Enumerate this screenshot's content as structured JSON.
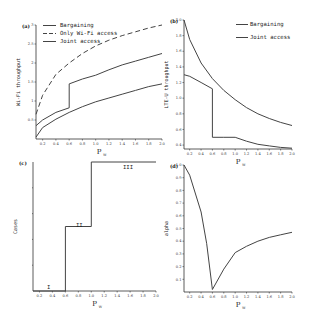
{
  "chart_data": [
    {
      "panel": "(a)",
      "type": "line",
      "xlabel": "P_W",
      "ylabel": "Wi-Fi throughput",
      "xlim": [
        0.1,
        2.0
      ],
      "ylim": [
        0,
        3
      ],
      "xticks": [
        "0.2",
        "0.4",
        "0.6",
        "0.8",
        "1.0",
        "1.2",
        "1.4",
        "1.6",
        "1.8",
        "2.0"
      ],
      "yticks": [
        "0.5",
        "1",
        "1.5",
        "2",
        "2.5",
        "3"
      ],
      "legend": [
        "Bargaining",
        "Only Wi-Fi access",
        "Joint access"
      ],
      "legend_position": "upper-left",
      "series": [
        {
          "name": "Bargaining",
          "style": "solid",
          "x": [
            0.1,
            0.2,
            0.4,
            0.6,
            0.6,
            0.8,
            1.0,
            1.2,
            1.4,
            1.6,
            1.8,
            2.0
          ],
          "y": [
            0.35,
            0.5,
            0.7,
            0.82,
            1.45,
            1.58,
            1.68,
            1.82,
            1.95,
            2.05,
            2.15,
            2.25
          ]
        },
        {
          "name": "Only Wi-Fi access",
          "style": "dashed",
          "x": [
            0.1,
            0.2,
            0.4,
            0.6,
            0.8,
            1.0,
            1.2,
            1.4,
            1.6,
            1.8,
            2.0
          ],
          "y": [
            0.65,
            1.15,
            1.7,
            2.0,
            2.25,
            2.45,
            2.6,
            2.72,
            2.82,
            2.92,
            3.0
          ]
        },
        {
          "name": "Joint access",
          "style": "solid",
          "x": [
            0.1,
            0.2,
            0.4,
            0.6,
            0.8,
            1.0,
            1.2,
            1.4,
            1.6,
            1.8,
            2.0
          ],
          "y": [
            0.05,
            0.3,
            0.52,
            0.7,
            0.85,
            0.98,
            1.08,
            1.18,
            1.28,
            1.38,
            1.45
          ]
        }
      ]
    },
    {
      "panel": "(b)",
      "type": "line",
      "xlabel": "P_W",
      "ylabel": "LTE-U throughput",
      "xlim": [
        0.1,
        2.0
      ],
      "ylim": [
        0.35,
        2.0
      ],
      "xticks": [
        "0.2",
        "0.4",
        "0.6",
        "0.8",
        "1.0",
        "1.2",
        "1.4",
        "1.6",
        "1.8",
        "2.0"
      ],
      "yticks": [
        "0.4",
        "0.6",
        "0.8",
        "1.0",
        "1.2",
        "1.4",
        "1.6",
        "1.8",
        "2.0"
      ],
      "legend": [
        "Bargaining",
        "Joint access"
      ],
      "legend_position": "upper-right",
      "series": [
        {
          "name": "Joint access",
          "style": "solid",
          "x": [
            0.1,
            0.2,
            0.4,
            0.6,
            0.8,
            1.0,
            1.2,
            1.4,
            1.6,
            1.8,
            2.0
          ],
          "y": [
            2.0,
            1.75,
            1.45,
            1.25,
            1.1,
            0.98,
            0.88,
            0.8,
            0.74,
            0.69,
            0.65
          ]
        },
        {
          "name": "Bargaining",
          "style": "solid",
          "x": [
            0.1,
            0.2,
            0.4,
            0.6,
            0.6,
            0.8,
            1.0,
            1.2,
            1.4,
            1.6,
            1.8,
            2.0
          ],
          "y": [
            1.3,
            1.28,
            1.2,
            1.12,
            0.5,
            0.5,
            0.5,
            0.45,
            0.41,
            0.39,
            0.37,
            0.36
          ]
        }
      ]
    },
    {
      "panel": "(c)",
      "type": "line",
      "xlabel": "P_W",
      "ylabel": "Cases",
      "xlim": [
        0.1,
        2.0
      ],
      "ylim": [
        0,
        3
      ],
      "xticks": [
        "0.2",
        "0.4",
        "0.6",
        "0.8",
        "1.0",
        "1.2",
        "1.4",
        "1.6",
        "1.8",
        "2.0"
      ],
      "annotations": [
        "I",
        "II",
        "III"
      ],
      "series": [
        {
          "name": "Case",
          "style": "step",
          "x": [
            0.1,
            0.6,
            0.6,
            1.0,
            1.0,
            2.0
          ],
          "y": [
            0,
            0,
            1.5,
            1.5,
            3,
            3
          ]
        }
      ]
    },
    {
      "panel": "(d)",
      "type": "line",
      "xlabel": "P_W",
      "ylabel": "alpha",
      "xlim": [
        0.1,
        2.0
      ],
      "ylim": [
        0,
        1.0
      ],
      "xticks": [
        "0.2",
        "0.4",
        "0.6",
        "0.8",
        "1.0",
        "1.2",
        "1.4",
        "1.6",
        "1.8",
        "2.0"
      ],
      "yticks": [
        "0.1",
        "0.2",
        "0.3",
        "0.4",
        "0.5",
        "0.6",
        "0.7",
        "0.8",
        "0.9",
        "1.0"
      ],
      "series": [
        {
          "name": "alpha",
          "style": "solid",
          "x": [
            0.1,
            0.2,
            0.4,
            0.5,
            0.6,
            0.8,
            1.0,
            1.2,
            1.4,
            1.6,
            1.8,
            2.0
          ],
          "y": [
            1.0,
            0.92,
            0.63,
            0.38,
            0.02,
            0.18,
            0.31,
            0.36,
            0.4,
            0.43,
            0.45,
            0.47
          ]
        }
      ]
    }
  ],
  "labels": {
    "a": {
      "panel": "(a)",
      "ylabel": "Wi-Fi throughput",
      "xlabel": "P",
      "xsub": "W",
      "legend": [
        "Bargaining",
        "Only Wi-Fi access",
        "Joint access"
      ]
    },
    "b": {
      "panel": "(b)",
      "ylabel": "LTE-U throughput",
      "xlabel": "P",
      "xsub": "W",
      "legend": [
        "Bargaining",
        "Joint access"
      ]
    },
    "c": {
      "panel": "(c)",
      "ylabel": "Cases",
      "xlabel": "P",
      "xsub": "W",
      "annotations": [
        "I",
        "II",
        "III"
      ]
    },
    "d": {
      "panel": "(d)",
      "ylabel": "alpha",
      "xlabel": "P",
      "xsub": "W"
    }
  }
}
